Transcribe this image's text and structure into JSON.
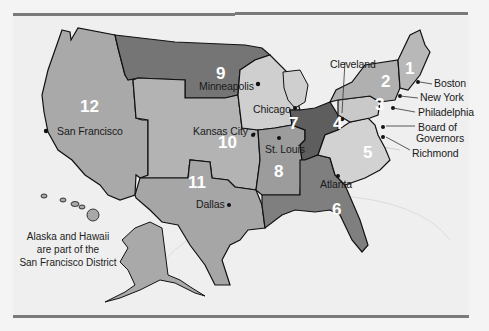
{
  "map": {
    "title": "Federal Reserve Districts",
    "colors": {
      "district_dark": "#6e6e6e",
      "district_mid": "#9a9a9a",
      "district_light": "#b5b5b5",
      "district_pale": "#cdcdcd",
      "background": "#efefef",
      "border": "#111111",
      "number": "#ffffff"
    },
    "districts": [
      {
        "number": "1",
        "city": "Boston"
      },
      {
        "number": "2",
        "city": "New York"
      },
      {
        "number": "3",
        "city": "Philadelphia"
      },
      {
        "number": "4",
        "city": "Cleveland"
      },
      {
        "number": "5",
        "city": "Richmond"
      },
      {
        "number": "6",
        "city": "Atlanta"
      },
      {
        "number": "7",
        "city": "Chicago"
      },
      {
        "number": "8",
        "city": "St. Louis"
      },
      {
        "number": "9",
        "city": "Minneapolis"
      },
      {
        "number": "10",
        "city": "Kansas City"
      },
      {
        "number": "11",
        "city": "Dallas"
      },
      {
        "number": "12",
        "city": "San Francisco"
      }
    ],
    "extra_labels": {
      "board": "Board of",
      "board2": "Governors"
    },
    "note": {
      "line1": "Alaska and Hawaii",
      "line2": "are part of the",
      "line3": "San Francisco District"
    }
  }
}
